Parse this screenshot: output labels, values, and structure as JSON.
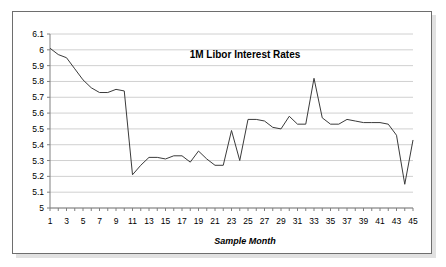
{
  "chart_data": {
    "type": "line",
    "title": "1M Libor Interest Rates",
    "xlabel": "Sample Month",
    "ylabel": "",
    "grid": true,
    "grid_axis": "y",
    "legend": "none",
    "xlim": [
      1,
      45
    ],
    "ylim": [
      5,
      6.1
    ],
    "ytick_step": 0.1,
    "yticks": [
      "5",
      "5.1",
      "5.2",
      "5.3",
      "5.4",
      "5.5",
      "5.6",
      "5.7",
      "5.8",
      "5.9",
      "6",
      "6.1"
    ],
    "xticks": [
      "1",
      "3",
      "5",
      "7",
      "9",
      "11",
      "13",
      "15",
      "17",
      "19",
      "21",
      "23",
      "25",
      "27",
      "29",
      "31",
      "33",
      "35",
      "37",
      "39",
      "41",
      "43",
      "45"
    ],
    "series": [
      {
        "name": "1M Libor",
        "color": "#3a3a3a",
        "x": [
          1,
          2,
          3,
          4,
          5,
          6,
          7,
          8,
          9,
          10,
          11,
          12,
          13,
          14,
          15,
          16,
          17,
          18,
          19,
          20,
          21,
          22,
          23,
          24,
          25,
          26,
          27,
          28,
          29,
          30,
          31,
          32,
          33,
          34,
          35,
          36,
          37,
          38,
          39,
          40,
          41,
          42,
          43,
          44,
          45
        ],
        "values": [
          6.01,
          5.97,
          5.95,
          5.88,
          5.81,
          5.76,
          5.73,
          5.73,
          5.75,
          5.74,
          5.21,
          5.27,
          5.32,
          5.32,
          5.31,
          5.33,
          5.33,
          5.29,
          5.36,
          5.31,
          5.27,
          5.27,
          5.49,
          5.3,
          5.56,
          5.56,
          5.55,
          5.51,
          5.5,
          5.58,
          5.53,
          5.53,
          5.82,
          5.57,
          5.53,
          5.53,
          5.56,
          5.55,
          5.54,
          5.54,
          5.54,
          5.53,
          5.46,
          5.15,
          5.43
        ]
      }
    ]
  },
  "chart_meta": {
    "plot_bg": "#ffffff",
    "gridline_color": "#d0d0d0",
    "axis_color": "#808080",
    "frame_border": "#6e6e6e"
  }
}
